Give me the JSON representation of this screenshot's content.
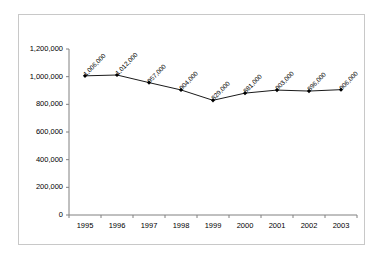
{
  "chart_data": {
    "type": "line",
    "title": "",
    "xlabel": "",
    "ylabel": "",
    "categories": [
      "1995",
      "1996",
      "1997",
      "1998",
      "1999",
      "2000",
      "2001",
      "2002",
      "2003"
    ],
    "values": [
      1006000,
      1012000,
      957000,
      904000,
      829000,
      881000,
      903000,
      896000,
      906000
    ],
    "point_labels": [
      "1,006,000",
      "1,012,000",
      "957,000",
      "904,000",
      "829,000",
      "881,000",
      "903,000",
      "896,000",
      "906,000"
    ],
    "ylim": [
      0,
      1200000
    ],
    "xlim_categories": [
      "1995",
      "2003"
    ],
    "y_ticks": [
      0,
      200000,
      400000,
      600000,
      800000,
      1000000,
      1200000
    ],
    "y_tick_labels": [
      "0",
      "200,000",
      "400,000",
      "600,000",
      "800,000",
      "1,000,000",
      "1,200,000"
    ],
    "x_tick_labels": [
      "1995",
      "1996",
      "1997",
      "1998",
      "1999",
      "2000",
      "2001",
      "2002",
      "2003"
    ],
    "grid": false,
    "legend": false,
    "legend_position": "none",
    "series_color": "#000000",
    "marker": "filled-diamond",
    "border_color": "#c8c8c8",
    "background_color": "#ffffff",
    "data_label_rotation_deg": -45
  }
}
